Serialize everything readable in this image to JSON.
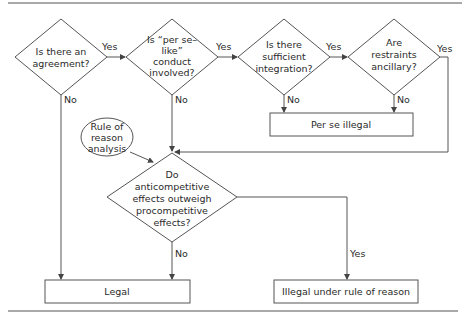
{
  "diagram": {
    "type": "flowchart",
    "decisions": [
      {
        "id": "d1",
        "lines": [
          "Is there an",
          "agreement?"
        ]
      },
      {
        "id": "d2",
        "lines": [
          "Is “per se–",
          "like”",
          "conduct",
          "involved?"
        ]
      },
      {
        "id": "d3",
        "lines": [
          "Is there",
          "sufficient",
          "integration?"
        ]
      },
      {
        "id": "d4",
        "lines": [
          "Are",
          "restraints",
          "ancillary?"
        ]
      },
      {
        "id": "d5",
        "lines": [
          "Do",
          "anticompetitive",
          "effects outweigh",
          "procompetitive",
          "effects?"
        ]
      }
    ],
    "start_node": {
      "id": "rule-of-reason",
      "lines": [
        "Rule of",
        "reason",
        "analysis"
      ]
    },
    "outcomes": [
      {
        "id": "per-se-illegal",
        "label": "Per se illegal"
      },
      {
        "id": "legal",
        "label": "Legal"
      },
      {
        "id": "illegal-rule-of-reason",
        "label": "Illegal under rule of reason"
      }
    ],
    "edge_labels": {
      "yes": "Yes",
      "no": "No"
    },
    "edges": [
      {
        "from": "d1",
        "to": "d2",
        "label": "Yes"
      },
      {
        "from": "d1",
        "to": "legal",
        "label": "No"
      },
      {
        "from": "d2",
        "to": "d3",
        "label": "Yes"
      },
      {
        "from": "d2",
        "to": "d5",
        "label": "No"
      },
      {
        "from": "d3",
        "to": "d4",
        "label": "Yes"
      },
      {
        "from": "d3",
        "to": "per-se-illegal",
        "label": "No"
      },
      {
        "from": "d4",
        "to": "d5",
        "label": "Yes"
      },
      {
        "from": "d4",
        "to": "per-se-illegal",
        "label": "No"
      },
      {
        "from": "rule-of-reason",
        "to": "d5",
        "label": ""
      },
      {
        "from": "d5",
        "to": "legal",
        "label": "No"
      },
      {
        "from": "d5",
        "to": "illegal-rule-of-reason",
        "label": "Yes"
      }
    ]
  }
}
